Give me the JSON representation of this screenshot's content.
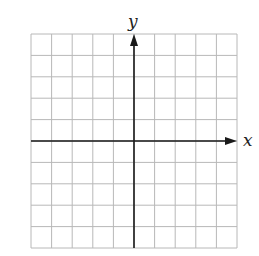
{
  "diagram": {
    "type": "coordinate-grid",
    "x_axis_label": "x",
    "y_axis_label": "y",
    "grid": {
      "columns": 10,
      "rows": 10,
      "left": 31,
      "top": 34,
      "right": 237,
      "bottom": 248
    },
    "origin": {
      "x": 134,
      "y": 141
    },
    "colors": {
      "grid_line": "#b8b8b8",
      "axis_line": "#1a1a1a",
      "background": "#ffffff"
    }
  }
}
